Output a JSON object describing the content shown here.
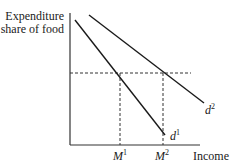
{
  "diagram": {
    "y_axis_label_line1": "Expenditure",
    "y_axis_label_line2": "share of food",
    "x_axis_label": "Income",
    "curves": [
      {
        "name": "d",
        "superscript": "1"
      },
      {
        "name": "d",
        "superscript": "2"
      }
    ],
    "x_ticks": [
      {
        "name": "M",
        "superscript": "1"
      },
      {
        "name": "M",
        "superscript": "2"
      }
    ],
    "colors": {
      "line": "#1a1a1a",
      "background": "#ffffff"
    }
  }
}
